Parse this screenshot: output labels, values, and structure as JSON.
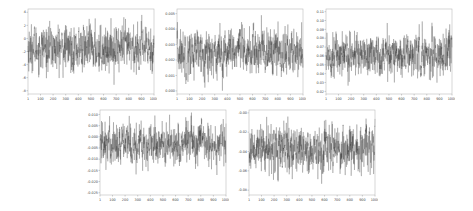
{
  "chart_data": [
    {
      "type": "line",
      "title": "",
      "xlabel": "",
      "ylabel": "",
      "x_range": [
        1,
        1000
      ],
      "x_ticks": [
        "1",
        "100",
        "200",
        "300",
        "400",
        "500",
        "600",
        "700",
        "800",
        "900",
        "1000"
      ],
      "y_ticks": [
        "4",
        "2",
        "0",
        "-2",
        "-4",
        "-6",
        "-8"
      ],
      "ylim": [
        -8.5,
        4.5
      ],
      "series": [
        {
          "name": "series-1",
          "mean": -1.5,
          "std": 1.6,
          "n": 1000,
          "color": "#222222"
        }
      ]
    },
    {
      "type": "line",
      "title": "",
      "xlabel": "",
      "ylabel": "",
      "x_range": [
        1,
        1000
      ],
      "x_ticks": [
        "1",
        "100",
        "200",
        "300",
        "400",
        "500",
        "600",
        "700",
        "800",
        "900",
        "1000"
      ],
      "y_ticks": [
        "0.005",
        "0.004",
        "0.003",
        "0.002",
        "0.001",
        "0.000"
      ],
      "ylim": [
        -0.0002,
        0.0053
      ],
      "series": [
        {
          "name": "series-2",
          "mean": 0.0025,
          "std": 0.0007,
          "n": 1000,
          "color": "#222222"
        }
      ]
    },
    {
      "type": "line",
      "title": "",
      "xlabel": "",
      "ylabel": "",
      "x_range": [
        1,
        1000
      ],
      "x_ticks": [
        "1",
        "100",
        "200",
        "300",
        "400",
        "500",
        "600",
        "700",
        "800",
        "900",
        "1000"
      ],
      "y_ticks": [
        "0.11",
        "0.10",
        "0.09",
        "0.08",
        "0.07",
        "0.06",
        "0.05",
        "0.04",
        "0.03",
        "0.02"
      ],
      "ylim": [
        0.017,
        0.113
      ],
      "series": [
        {
          "name": "series-3",
          "mean": 0.062,
          "std": 0.011,
          "n": 1000,
          "color": "#222222"
        }
      ]
    },
    {
      "type": "line",
      "title": "",
      "xlabel": "",
      "ylabel": "",
      "x_range": [
        1,
        1000
      ],
      "x_ticks": [
        "1",
        "100",
        "200",
        "300",
        "400",
        "500",
        "600",
        "700",
        "800",
        "900",
        "1000"
      ],
      "y_ticks": [
        "0.010",
        "0.005",
        "0.000",
        "-0.005",
        "-0.010",
        "-0.015",
        "-0.020",
        "-0.025"
      ],
      "ylim": [
        -0.026,
        0.012
      ],
      "series": [
        {
          "name": "series-4",
          "mean": -0.003,
          "std": 0.0045,
          "n": 1000,
          "color": "#222222"
        }
      ]
    },
    {
      "type": "line",
      "title": "",
      "xlabel": "",
      "ylabel": "",
      "x_range": [
        1,
        1000
      ],
      "x_ticks": [
        "1",
        "100",
        "200",
        "300",
        "400",
        "500",
        "600",
        "700",
        "800",
        "900",
        "1000"
      ],
      "y_ticks": [
        "-0.00",
        "-0.02",
        "-0.04",
        "-0.06",
        "-0.08"
      ],
      "ylim": [
        -0.085,
        0.003
      ],
      "series": [
        {
          "name": "series-5",
          "mean": -0.037,
          "std": 0.011,
          "n": 1000,
          "color": "#222222"
        }
      ]
    }
  ],
  "layout": {
    "panels": [
      {
        "left": 14,
        "top": 6,
        "width": 143,
        "height": 97
      },
      {
        "left": 163,
        "top": 6,
        "width": 143,
        "height": 97
      },
      {
        "left": 312,
        "top": 6,
        "width": 143,
        "height": 97
      },
      {
        "left": 86,
        "top": 107,
        "width": 143,
        "height": 97
      },
      {
        "left": 235,
        "top": 107,
        "width": 143,
        "height": 97
      }
    ]
  }
}
